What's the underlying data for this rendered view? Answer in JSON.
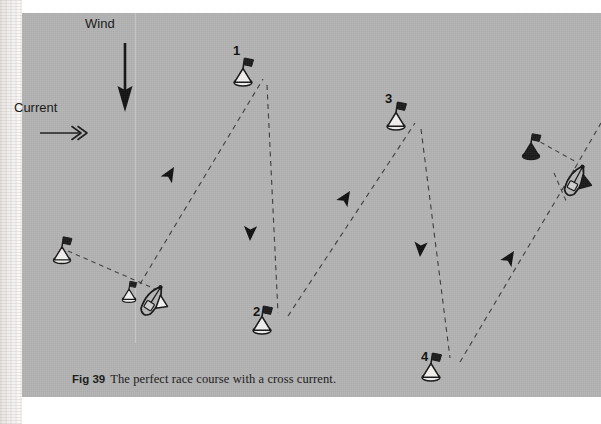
{
  "figure": {
    "caption_number": "Fig 39",
    "caption_text": "The perfect race course with a cross current.",
    "panel_color": "#b2b2b2",
    "ink_color": "#111111"
  },
  "annotations": {
    "wind_label": "Wind",
    "current_label": "Current"
  },
  "marks": [
    {
      "id": "1",
      "label": "1",
      "x": 243,
      "y": 63,
      "icon": "buoy-flag-icon"
    },
    {
      "id": "2",
      "label": "2",
      "x": 261,
      "y": 312,
      "icon": "buoy-flag-icon"
    },
    {
      "id": "3",
      "label": "3",
      "x": 395,
      "y": 106,
      "icon": "buoy-flag-icon"
    },
    {
      "id": "4",
      "label": "4",
      "x": 431,
      "y": 357,
      "icon": "buoy-flag-icon"
    }
  ],
  "boats": [
    {
      "name": "start-line-boat",
      "x": 152,
      "y": 289,
      "flag": "light"
    },
    {
      "name": "finish-line-boat",
      "x": 575,
      "y": 167,
      "flag": "dark"
    }
  ],
  "line_buoys": [
    {
      "name": "start-line-pin-buoy",
      "x": 62,
      "y": 246
    },
    {
      "name": "start-line-inner-buoy",
      "x": 129,
      "y": 283
    },
    {
      "name": "finish-line-buoy",
      "x": 531,
      "y": 139
    }
  ],
  "leg_arrows": [
    {
      "name": "leg-start-to-1",
      "x": 170,
      "y": 158,
      "rotation": -58
    },
    {
      "name": "leg-1-to-2",
      "x": 247,
      "y": 222,
      "rotation": 90
    },
    {
      "name": "leg-2-to-3",
      "x": 345,
      "y": 182,
      "rotation": -55
    },
    {
      "name": "leg-3-to-4",
      "x": 417,
      "y": 237,
      "rotation": 90
    },
    {
      "name": "leg-4-to-finish",
      "x": 505,
      "y": 245,
      "rotation": -48
    }
  ],
  "course_path": {
    "type": "dashed",
    "points": [
      {
        "name": "start",
        "x": 140,
        "y": 282
      },
      {
        "name": "mark-1",
        "x": 243,
        "y": 68
      },
      {
        "name": "mark-2",
        "x": 257,
        "y": 310
      },
      {
        "name": "mark-3",
        "x": 395,
        "y": 110
      },
      {
        "name": "mark-4",
        "x": 430,
        "y": 356
      },
      {
        "name": "finish",
        "x": 553,
        "y": 158
      }
    ]
  },
  "lines": {
    "start_line": {
      "from": {
        "x": 68,
        "y": 250
      },
      "to": {
        "x": 152,
        "y": 287
      }
    },
    "finish_line": {
      "from": {
        "x": 528,
        "y": 142
      },
      "to": {
        "x": 570,
        "y": 166
      }
    }
  }
}
